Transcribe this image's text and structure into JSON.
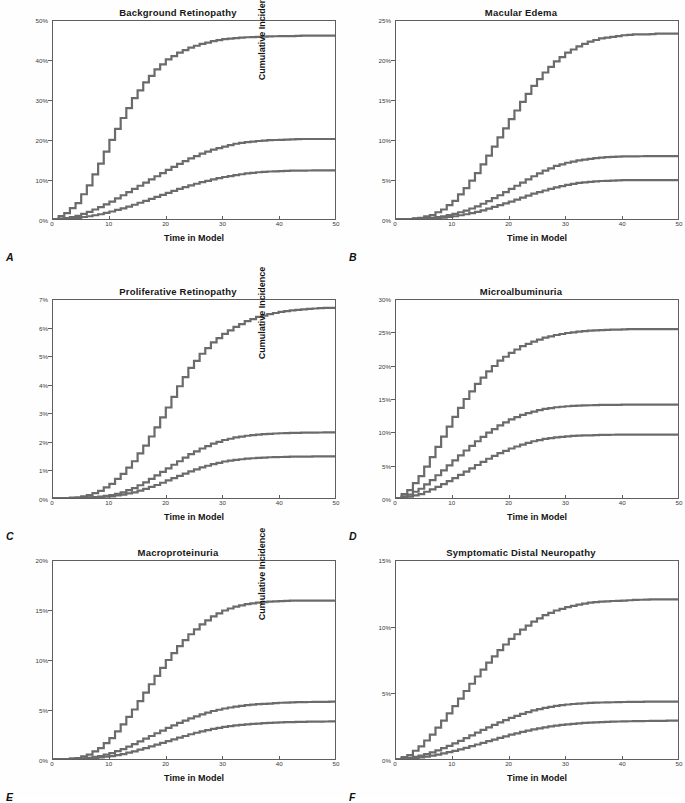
{
  "figure": {
    "axis_labels": {
      "y": "Cumulative Incidence",
      "x": "Time in Model"
    },
    "x_ticks": [
      "0",
      "10",
      "20",
      "30",
      "40",
      "50"
    ],
    "line_color": "#6b6b6b",
    "axis_color": "#5f5f5f",
    "background": "#ffffff"
  },
  "panels": [
    {
      "letter": "A",
      "title": "Background Retinopathy",
      "y_ticks": [
        "50%",
        "40%",
        "30%",
        "20%",
        "10%",
        "0%"
      ],
      "left": 0,
      "top": 6
    },
    {
      "letter": "B",
      "title": "Macular Edema",
      "y_ticks": [
        "25%",
        "20%",
        "15%",
        "10%",
        "5%",
        "0%"
      ],
      "left": 343,
      "top": 6
    },
    {
      "letter": "C",
      "title": "Proliferative Retinopathy",
      "y_ticks": [
        "7%",
        "6%",
        "5%",
        "4%",
        "3%",
        "2%",
        "1%",
        "0%"
      ],
      "left": 0,
      "top": 285
    },
    {
      "letter": "D",
      "title": "Microalbuminuria",
      "y_ticks": [
        "30%",
        "25%",
        "20%",
        "15%",
        "10%",
        "5%",
        "0%"
      ],
      "left": 343,
      "top": 285
    },
    {
      "letter": "E",
      "title": "Macroproteinuria",
      "y_ticks": [
        "20%",
        "15%",
        "10%",
        "5%",
        "0%"
      ],
      "left": 0,
      "top": 546
    },
    {
      "letter": "F",
      "title": "Symptomatic Distal Neuropathy",
      "y_ticks": [
        "15%",
        "10%",
        "5%",
        "0%"
      ],
      "left": 343,
      "top": 546
    }
  ],
  "chart_data": [
    {
      "panel": "A",
      "type": "line",
      "title": "Background Retinopathy",
      "xlabel": "Time in Model",
      "ylabel": "Cumulative Incidence",
      "xlim": [
        0,
        50
      ],
      "ylim": [
        0,
        50
      ],
      "yunit": "%",
      "grid": false,
      "legend": "none",
      "x": [
        0,
        2,
        4,
        6,
        8,
        10,
        12,
        14,
        16,
        18,
        20,
        22,
        24,
        26,
        28,
        30,
        32,
        34,
        36,
        38,
        40,
        42,
        44,
        46,
        48,
        50
      ],
      "series": [
        {
          "name": "curve-1-high-risk",
          "values": [
            0,
            1.5,
            4,
            8.5,
            14,
            20,
            25.5,
            30.5,
            34.5,
            37.8,
            40.3,
            42,
            43.3,
            44.2,
            44.9,
            45.4,
            45.7,
            45.9,
            46.0,
            46.1,
            46.2,
            46.2,
            46.3,
            46.3,
            46.3,
            46.3
          ]
        },
        {
          "name": "curve-2-mid-risk",
          "values": [
            0,
            0.2,
            0.8,
            1.8,
            3.0,
            4.4,
            6.0,
            7.6,
            9.2,
            10.8,
            12.4,
            13.9,
            15.3,
            16.5,
            17.5,
            18.3,
            19.0,
            19.4,
            19.7,
            19.9,
            20.0,
            20.1,
            20.2,
            20.2,
            20.2,
            20.2
          ]
        },
        {
          "name": "curve-3-low-risk",
          "values": [
            0,
            0.1,
            0.3,
            0.7,
            1.2,
            1.9,
            2.7,
            3.6,
            4.6,
            5.6,
            6.6,
            7.6,
            8.5,
            9.3,
            10.0,
            10.6,
            11.1,
            11.5,
            11.8,
            12.0,
            12.1,
            12.2,
            12.2,
            12.3,
            12.3,
            12.3
          ]
        }
      ]
    },
    {
      "panel": "B",
      "type": "line",
      "title": "Macular Edema",
      "xlabel": "Time in Model",
      "ylabel": "Cumulative Incidence",
      "xlim": [
        0,
        50
      ],
      "ylim": [
        0,
        25
      ],
      "yunit": "%",
      "grid": false,
      "legend": "none",
      "x": [
        0,
        2,
        4,
        6,
        8,
        10,
        12,
        14,
        16,
        18,
        20,
        22,
        24,
        26,
        28,
        30,
        32,
        34,
        36,
        38,
        40,
        42,
        44,
        46,
        48,
        50
      ],
      "series": [
        {
          "name": "curve-1-high-risk",
          "values": [
            0,
            0,
            0.15,
            0.5,
            1.2,
            2.3,
            3.9,
            5.8,
            8.0,
            10.3,
            12.6,
            14.8,
            16.8,
            18.5,
            19.9,
            21.0,
            21.8,
            22.4,
            22.8,
            23.0,
            23.2,
            23.3,
            23.3,
            23.4,
            23.4,
            23.4
          ]
        },
        {
          "name": "curve-2-mid-risk",
          "values": [
            0,
            0,
            0.05,
            0.15,
            0.35,
            0.65,
            1.05,
            1.6,
            2.25,
            3.0,
            3.8,
            4.6,
            5.4,
            6.1,
            6.7,
            7.1,
            7.4,
            7.6,
            7.75,
            7.85,
            7.9,
            7.9,
            7.95,
            7.95,
            7.95,
            7.95
          ]
        },
        {
          "name": "curve-3-low-risk",
          "values": [
            0,
            0,
            0.03,
            0.08,
            0.18,
            0.35,
            0.6,
            0.9,
            1.3,
            1.75,
            2.2,
            2.7,
            3.2,
            3.6,
            4.0,
            4.3,
            4.55,
            4.7,
            4.8,
            4.85,
            4.9,
            4.9,
            4.92,
            4.92,
            4.92,
            4.92
          ]
        }
      ]
    },
    {
      "panel": "C",
      "type": "line",
      "title": "Proliferative Retinopathy",
      "xlabel": "Time in Model",
      "ylabel": "Cumulative Incidence",
      "xlim": [
        0,
        50
      ],
      "ylim": [
        0,
        7
      ],
      "yunit": "%",
      "grid": false,
      "legend": "none",
      "x": [
        0,
        2,
        4,
        6,
        8,
        10,
        12,
        14,
        16,
        18,
        20,
        22,
        24,
        26,
        28,
        30,
        32,
        34,
        36,
        38,
        40,
        42,
        44,
        46,
        48,
        50
      ],
      "series": [
        {
          "name": "curve-1-high-risk",
          "values": [
            0,
            0,
            0.02,
            0.1,
            0.25,
            0.5,
            0.85,
            1.3,
            1.85,
            2.5,
            3.2,
            3.95,
            4.6,
            5.1,
            5.5,
            5.8,
            6.05,
            6.25,
            6.4,
            6.5,
            6.58,
            6.63,
            6.67,
            6.7,
            6.72,
            6.73
          ]
        },
        {
          "name": "curve-2-mid-risk",
          "values": [
            0,
            0,
            0,
            0.02,
            0.05,
            0.1,
            0.2,
            0.35,
            0.55,
            0.8,
            1.05,
            1.3,
            1.55,
            1.75,
            1.92,
            2.05,
            2.14,
            2.2,
            2.24,
            2.27,
            2.29,
            2.3,
            2.31,
            2.31,
            2.32,
            2.32
          ]
        },
        {
          "name": "curve-3-low-risk",
          "values": [
            0,
            0,
            0,
            0.01,
            0.03,
            0.06,
            0.12,
            0.2,
            0.32,
            0.46,
            0.62,
            0.78,
            0.94,
            1.08,
            1.2,
            1.29,
            1.35,
            1.39,
            1.42,
            1.44,
            1.45,
            1.46,
            1.46,
            1.47,
            1.47,
            1.47
          ]
        }
      ]
    },
    {
      "panel": "D",
      "type": "line",
      "title": "Microalbuminuria",
      "xlabel": "Time in Model",
      "ylabel": "Cumulative Incidence",
      "xlim": [
        0,
        50
      ],
      "ylim": [
        0,
        30
      ],
      "yunit": "%",
      "grid": false,
      "legend": "none",
      "x": [
        0,
        2,
        4,
        6,
        8,
        10,
        12,
        14,
        16,
        18,
        20,
        22,
        24,
        26,
        28,
        30,
        32,
        34,
        36,
        38,
        40,
        42,
        44,
        46,
        48,
        50
      ],
      "series": [
        {
          "name": "curve-1-high-risk",
          "values": [
            0,
            1.2,
            3.3,
            6.2,
            9.3,
            12.3,
            15.0,
            17.3,
            19.2,
            20.8,
            22.0,
            23.0,
            23.7,
            24.3,
            24.7,
            25.0,
            25.2,
            25.35,
            25.45,
            25.5,
            25.55,
            25.6,
            25.6,
            25.6,
            25.6,
            25.6
          ]
        },
        {
          "name": "curve-2-mid-risk",
          "values": [
            0,
            0.5,
            1.4,
            2.7,
            4.2,
            5.7,
            7.2,
            8.6,
            9.9,
            11.0,
            11.9,
            12.6,
            13.1,
            13.5,
            13.75,
            13.9,
            14.0,
            14.05,
            14.1,
            14.1,
            14.15,
            14.15,
            14.15,
            14.15,
            14.15,
            14.15
          ]
        },
        {
          "name": "curve-3-low-risk",
          "values": [
            0,
            0.2,
            0.6,
            1.3,
            2.1,
            3.0,
            4.0,
            5.0,
            5.95,
            6.8,
            7.5,
            8.1,
            8.6,
            8.95,
            9.2,
            9.35,
            9.45,
            9.5,
            9.55,
            9.58,
            9.6,
            9.6,
            9.6,
            9.6,
            9.6,
            9.6
          ]
        }
      ]
    },
    {
      "panel": "E",
      "type": "line",
      "title": "Macroproteinuria",
      "xlabel": "Time in Model",
      "ylabel": "Cumulative Incidence",
      "xlim": [
        0,
        50
      ],
      "ylim": [
        0,
        20
      ],
      "yunit": "%",
      "grid": false,
      "legend": "none",
      "x": [
        0,
        2,
        4,
        6,
        8,
        10,
        12,
        14,
        16,
        18,
        20,
        22,
        24,
        26,
        28,
        30,
        32,
        34,
        36,
        38,
        40,
        42,
        44,
        46,
        48,
        50
      ],
      "series": [
        {
          "name": "curve-1-high-risk",
          "values": [
            0,
            0,
            0.1,
            0.45,
            1.1,
            2.1,
            3.5,
            5.0,
            6.7,
            8.4,
            10.0,
            11.4,
            12.6,
            13.6,
            14.4,
            15.0,
            15.4,
            15.65,
            15.8,
            15.9,
            15.95,
            16.0,
            16.0,
            16.0,
            16.0,
            16.0
          ]
        },
        {
          "name": "curve-2-mid-risk",
          "values": [
            0,
            0,
            0.03,
            0.12,
            0.3,
            0.6,
            1.0,
            1.5,
            2.05,
            2.6,
            3.15,
            3.65,
            4.1,
            4.5,
            4.85,
            5.1,
            5.3,
            5.45,
            5.55,
            5.6,
            5.68,
            5.72,
            5.75,
            5.77,
            5.78,
            5.8
          ]
        },
        {
          "name": "curve-3-low-risk",
          "values": [
            0,
            0,
            0.01,
            0.05,
            0.15,
            0.3,
            0.5,
            0.78,
            1.1,
            1.45,
            1.8,
            2.15,
            2.5,
            2.8,
            3.05,
            3.25,
            3.4,
            3.5,
            3.58,
            3.65,
            3.7,
            3.73,
            3.76,
            3.78,
            3.79,
            3.8
          ]
        }
      ]
    },
    {
      "panel": "F",
      "type": "line",
      "title": "Symptomatic Distal Neuropathy",
      "xlabel": "Time in Model",
      "ylabel": "Cumulative Incidence",
      "xlim": [
        0,
        50
      ],
      "ylim": [
        0,
        15
      ],
      "yunit": "%",
      "grid": false,
      "legend": "none",
      "x": [
        0,
        2,
        4,
        6,
        8,
        10,
        12,
        14,
        16,
        18,
        20,
        22,
        24,
        26,
        28,
        30,
        32,
        34,
        36,
        38,
        40,
        42,
        44,
        46,
        48,
        50
      ],
      "series": [
        {
          "name": "curve-1-high-risk",
          "values": [
            0,
            0.3,
            0.95,
            1.85,
            2.9,
            4.0,
            5.15,
            6.25,
            7.3,
            8.25,
            9.1,
            9.8,
            10.4,
            10.9,
            11.25,
            11.5,
            11.7,
            11.85,
            11.92,
            11.97,
            12.0,
            12.05,
            12.08,
            12.1,
            12.1,
            12.1
          ]
        },
        {
          "name": "curve-2-mid-risk",
          "values": [
            0,
            0.08,
            0.25,
            0.5,
            0.82,
            1.18,
            1.58,
            2.0,
            2.4,
            2.78,
            3.12,
            3.42,
            3.68,
            3.88,
            4.03,
            4.13,
            4.2,
            4.25,
            4.28,
            4.3,
            4.32,
            4.33,
            4.34,
            4.35,
            4.35,
            4.35
          ]
        },
        {
          "name": "curve-3-low-risk",
          "values": [
            0,
            0.04,
            0.12,
            0.25,
            0.42,
            0.62,
            0.85,
            1.1,
            1.35,
            1.6,
            1.84,
            2.05,
            2.24,
            2.4,
            2.53,
            2.63,
            2.7,
            2.76,
            2.8,
            2.83,
            2.85,
            2.87,
            2.88,
            2.89,
            2.9,
            2.9
          ]
        }
      ]
    }
  ]
}
